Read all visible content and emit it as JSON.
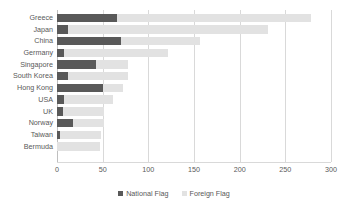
{
  "chart_data": {
    "type": "bar",
    "orientation": "horizontal",
    "stacked": true,
    "title": "",
    "xlabel": "",
    "ylabel": "",
    "xlim": [
      0,
      300
    ],
    "xticks": [
      "0",
      "50",
      "100",
      "150",
      "200",
      "250",
      "300"
    ],
    "grid": true,
    "legend_position": "bottom",
    "categories": [
      "Greece",
      "Japan",
      "China",
      "Germany",
      "Singapore",
      "South Korea",
      "Hong Kong",
      "USA",
      "UK",
      "Norway",
      "Taiwan",
      "Bermuda"
    ],
    "series": [
      {
        "name": "National Flag",
        "color": "#595959",
        "values": [
          66,
          12,
          70,
          8,
          43,
          12,
          50,
          8,
          7,
          18,
          3,
          0
        ]
      },
      {
        "name": "Foreign Flag",
        "color": "#e2e2e2",
        "values": [
          212,
          219,
          87,
          113,
          35,
          66,
          22,
          53,
          45,
          34,
          45,
          47
        ]
      }
    ],
    "totals": [
      278,
      231,
      157,
      121,
      78,
      78,
      72,
      61,
      52,
      52,
      48,
      47
    ]
  },
  "legend": {
    "items": [
      {
        "label": "National Flag",
        "swatch": "national-flag-swatch"
      },
      {
        "label": "Foreign Flag",
        "swatch": "foreign-flag-swatch"
      }
    ]
  },
  "colors": {
    "national": "#595959",
    "foreign": "#e2e2e2",
    "gridline": "#d9d9d9",
    "text": "#595959",
    "background": "#ffffff"
  }
}
